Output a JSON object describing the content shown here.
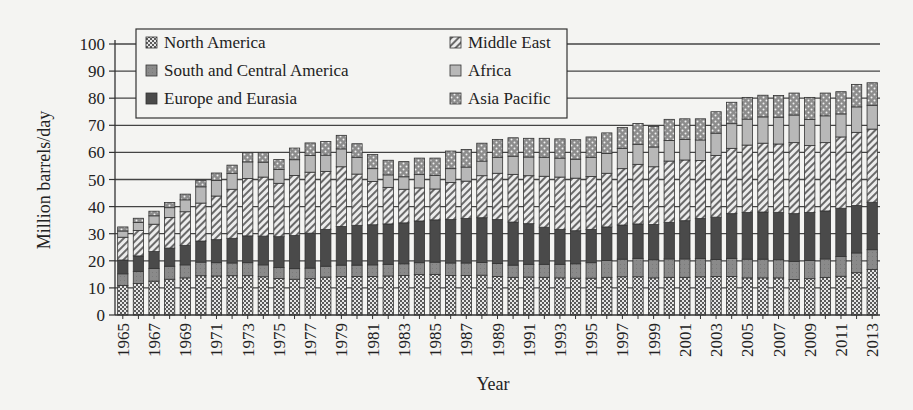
{
  "chart_data": {
    "type": "bar",
    "stacked": true,
    "title": "",
    "xlabel": "Year",
    "ylabel": "Million barrels/day",
    "ylim": [
      0,
      100
    ],
    "yticks": [
      0,
      10,
      20,
      30,
      40,
      50,
      60,
      70,
      80,
      90,
      100
    ],
    "grid": true,
    "legend_position": "top-left (inside, 2 columns)",
    "categories": [
      "1965",
      "1966",
      "1967",
      "1968",
      "1969",
      "1970",
      "1971",
      "1972",
      "1973",
      "1974",
      "1975",
      "1976",
      "1977",
      "1978",
      "1979",
      "1980",
      "1981",
      "1982",
      "1983",
      "1984",
      "1985",
      "1986",
      "1987",
      "1988",
      "1989",
      "1990",
      "1991",
      "1992",
      "1993",
      "1994",
      "1995",
      "1996",
      "1997",
      "1998",
      "1999",
      "2000",
      "2001",
      "2002",
      "2003",
      "2004",
      "2005",
      "2006",
      "2007",
      "2008",
      "2009",
      "2010",
      "2011",
      "2012",
      "2013"
    ],
    "xtick_labels": [
      "1965",
      "1967",
      "1969",
      "1971",
      "1973",
      "1975",
      "1977",
      "1979",
      "1981",
      "1983",
      "1985",
      "1987",
      "1989",
      "1991",
      "1993",
      "1995",
      "1997",
      "1999",
      "2001",
      "2003",
      "2005",
      "2007",
      "2009",
      "2011",
      "2013"
    ],
    "series": [
      {
        "name": "North America",
        "pattern": "checker",
        "values": [
          10.9,
          11.6,
          12.5,
          13.2,
          13.7,
          14.5,
          14.4,
          14.5,
          14.5,
          14.1,
          13.5,
          13.2,
          13.4,
          14.0,
          14.2,
          14.2,
          14.2,
          14.4,
          14.6,
          14.9,
          15.0,
          14.6,
          14.6,
          14.7,
          14.2,
          13.9,
          14.0,
          13.9,
          13.7,
          13.6,
          13.6,
          13.9,
          14.1,
          14.1,
          13.7,
          13.9,
          13.9,
          14.1,
          14.2,
          14.2,
          13.7,
          13.7,
          13.7,
          13.1,
          13.4,
          13.8,
          14.3,
          15.6,
          16.8
        ]
      },
      {
        "name": "South and Central America",
        "pattern": "solid-mid",
        "values": [
          4.3,
          4.5,
          4.7,
          4.8,
          4.8,
          5.0,
          4.9,
          4.7,
          4.8,
          4.4,
          4.0,
          3.9,
          3.9,
          4.0,
          4.2,
          4.2,
          4.3,
          4.3,
          4.3,
          4.4,
          4.5,
          4.6,
          4.6,
          4.7,
          4.8,
          4.5,
          4.7,
          4.8,
          5.0,
          5.3,
          5.7,
          6.2,
          6.5,
          6.8,
          6.7,
          6.8,
          6.8,
          6.7,
          6.3,
          6.7,
          6.9,
          6.9,
          6.7,
          6.7,
          6.7,
          6.9,
          7.3,
          7.3,
          7.3
        ]
      },
      {
        "name": "Europe and Eurasia",
        "pattern": "solid-dark",
        "values": [
          5.1,
          5.7,
          6.2,
          6.7,
          7.2,
          7.8,
          8.5,
          9.1,
          9.9,
          10.6,
          11.4,
          12.2,
          12.9,
          13.6,
          14.3,
          14.7,
          14.8,
          14.9,
          15.1,
          15.4,
          15.6,
          16.0,
          16.4,
          16.5,
          16.2,
          15.9,
          15.0,
          13.7,
          12.9,
          12.2,
          12.3,
          12.4,
          12.6,
          12.7,
          13.0,
          13.5,
          14.1,
          14.8,
          15.6,
          16.5,
          17.2,
          17.4,
          17.5,
          17.6,
          17.7,
          17.7,
          17.8,
          17.5,
          17.5
        ]
      },
      {
        "name": "Middle East",
        "pattern": "diagonal",
        "values": [
          8.4,
          9.4,
          10.1,
          11.3,
          12.4,
          14.0,
          16.1,
          18.1,
          21.2,
          21.8,
          19.7,
          22.2,
          22.5,
          21.4,
          22.0,
          18.9,
          16.0,
          13.5,
          12.4,
          12.2,
          11.4,
          13.7,
          13.8,
          15.5,
          17.1,
          17.6,
          17.7,
          18.8,
          19.3,
          19.4,
          19.5,
          19.8,
          20.8,
          22.0,
          21.3,
          22.6,
          22.4,
          21.4,
          22.8,
          24.1,
          24.9,
          25.4,
          25.2,
          26.2,
          24.7,
          25.2,
          26.3,
          27.0,
          27.0
        ]
      },
      {
        "name": "Africa",
        "pattern": "solid-light",
        "values": [
          2.3,
          2.9,
          3.1,
          3.6,
          4.4,
          6.0,
          5.8,
          5.9,
          6.1,
          5.5,
          5.1,
          5.8,
          6.2,
          6.0,
          6.6,
          6.2,
          4.7,
          4.6,
          4.6,
          4.9,
          5.0,
          5.1,
          5.2,
          5.4,
          5.9,
          6.7,
          6.9,
          7.0,
          7.0,
          7.0,
          7.1,
          7.3,
          7.5,
          7.4,
          7.3,
          7.6,
          7.6,
          7.6,
          8.2,
          9.1,
          9.6,
          9.7,
          9.9,
          10.2,
          9.7,
          9.9,
          8.5,
          9.4,
          8.8
        ]
      },
      {
        "name": "Asia Pacific",
        "pattern": "dots",
        "values": [
          1.5,
          1.6,
          1.7,
          1.9,
          2.1,
          2.4,
          2.7,
          3.0,
          3.4,
          3.6,
          3.7,
          4.3,
          4.6,
          5.0,
          5.0,
          5.0,
          5.2,
          5.4,
          5.6,
          6.1,
          6.4,
          6.5,
          6.5,
          6.6,
          6.6,
          6.8,
          6.9,
          7.0,
          7.1,
          7.2,
          7.5,
          7.6,
          7.7,
          7.7,
          7.6,
          7.8,
          7.6,
          7.8,
          7.9,
          7.9,
          8.0,
          8.0,
          8.0,
          8.1,
          8.1,
          8.4,
          8.2,
          8.3,
          8.3
        ]
      }
    ],
    "totals_approx": [
      32.5,
      35.7,
      38.3,
      41.5,
      44.6,
      49.7,
      52.4,
      55.3,
      59.9,
      60.0,
      57.4,
      61.6,
      63.5,
      64.0,
      66.3,
      63.2,
      59.2,
      57.1,
      56.6,
      57.9,
      57.9,
      60.5,
      61.1,
      63.4,
      64.8,
      65.4,
      65.2,
      65.2,
      65.0,
      64.7,
      65.7,
      67.2,
      69.2,
      70.7,
      69.6,
      72.2,
      72.4,
      72.4,
      75.0,
      78.5,
      80.3,
      81.1,
      81.0,
      81.9,
      80.3,
      81.9,
      82.4,
      85.1,
      85.7
    ]
  },
  "legend": {
    "items": [
      {
        "label": "North America",
        "pattern": "checker"
      },
      {
        "label": "South and Central America",
        "pattern": "solid-mid"
      },
      {
        "label": "Europe and Eurasia",
        "pattern": "solid-dark"
      },
      {
        "label": "Middle East",
        "pattern": "diagonal"
      },
      {
        "label": "Africa",
        "pattern": "solid-light"
      },
      {
        "label": "Asia Pacific",
        "pattern": "dots"
      }
    ]
  },
  "colors": {
    "background": "#f4f4f2",
    "axis": "#333333",
    "grid": "#444444",
    "bar_outline": "#333333",
    "solid_dark": "#4a4a4a",
    "solid_mid": "#8a8a8a",
    "solid_light": "#b8b8b8",
    "pattern_fg": "#555555",
    "pattern_bg": "#e8e8e8"
  }
}
